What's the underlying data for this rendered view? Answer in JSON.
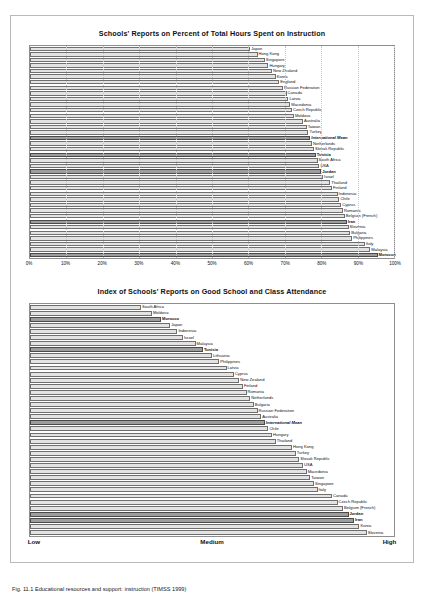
{
  "caption": "Fig. 11.1 Educational resources and support: instruction (TIMSS 1999)",
  "chart_data": [
    {
      "type": "bar",
      "title": "Schools' Reports on Percent of Total Hours Spent on Instruction",
      "xlabel": "",
      "ylabel": "",
      "xlim": [
        0,
        100
      ],
      "grid": true,
      "orientation": "horizontal",
      "ticks": [
        "0%",
        "10%",
        "20%",
        "30%",
        "40%",
        "50%",
        "60%",
        "70%",
        "80%",
        "90%",
        "100%"
      ],
      "categories": [
        "Japan",
        "Hong Kong",
        "Singapore",
        "Hungary",
        "New Zealand",
        "Korea",
        "England",
        "Russian Federation",
        "Canada",
        "Latvia",
        "Macedonia",
        "Czech Republic",
        "Moldova",
        "Australia",
        "Taiwan",
        "Turkey",
        "International Mean",
        "Netherlands",
        "Slovak Republic",
        "Tunisia",
        "South Africa",
        "USA",
        "Jordan",
        "Israel",
        "Thailand",
        "Finland",
        "Indonesia",
        "Chile",
        "Cyprus",
        "Romania",
        "Belgium (French)",
        "Iran",
        "Slovenia",
        "Bulgaria",
        "Philippines",
        "Italy",
        "Malaysia",
        "Morocco"
      ],
      "values": [
        60.5,
        62.5,
        64.5,
        65.5,
        66.5,
        67.5,
        68.5,
        69.5,
        70.5,
        71.0,
        71.5,
        72.0,
        72.5,
        75.0,
        76.0,
        76.5,
        77.0,
        77.5,
        78.0,
        78.5,
        79.0,
        79.5,
        80.0,
        80.5,
        82.5,
        83.0,
        84.5,
        85.0,
        85.5,
        86.0,
        86.5,
        87.0,
        87.5,
        88.0,
        88.5,
        92.0,
        93.5,
        95.5
      ],
      "highlighted": [
        "International Mean",
        "Tunisia",
        "Jordan",
        "Iran",
        "Morocco"
      ]
    },
    {
      "type": "bar",
      "title": "Index of Schools' Reports on Good School and Class Attendance",
      "xlabel": "",
      "ylabel": "",
      "grid": false,
      "orientation": "horizontal",
      "ticks": [
        "Low",
        "Medium",
        "High"
      ],
      "categories": [
        "South Africa",
        "Moldova",
        "Morocco",
        "Japan",
        "Indonesia",
        "Israel",
        "Malaysia",
        "Tunisia",
        "Lithuania",
        "Philippines",
        "Latvia",
        "Cyprus",
        "New Zealand",
        "Finland",
        "Romania",
        "Netherlands",
        "Bulgaria",
        "Russian Federation",
        "Australia",
        "International Mean",
        "Chile",
        "Hungary",
        "Thailand",
        "Hong Kong",
        "Turkey",
        "Slovak Republic",
        "USA",
        "Macedonia",
        "Taiwan",
        "Singapore",
        "Italy",
        "Canada",
        "Czech Republic",
        "Belgium (French)",
        "Jordan",
        "Iran",
        "Korea",
        "Slovenia"
      ],
      "values": [
        30.5,
        33.5,
        36.0,
        38.5,
        40.5,
        42.0,
        45.5,
        47.5,
        50.0,
        52.0,
        54.0,
        56.0,
        57.5,
        58.5,
        59.5,
        60.5,
        61.5,
        62.5,
        63.5,
        64.5,
        65.5,
        66.5,
        67.5,
        72.0,
        73.0,
        74.0,
        75.0,
        76.0,
        77.0,
        78.0,
        79.0,
        83.0,
        84.5,
        86.0,
        87.5,
        89.0,
        90.5,
        92.5
      ],
      "highlighted": [
        "Morocco",
        "Tunisia",
        "International Mean",
        "Jordan",
        "Iran"
      ]
    }
  ]
}
